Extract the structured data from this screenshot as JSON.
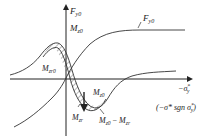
{
  "diagram": {
    "axes": {
      "y_label_main": "F",
      "y_label_main_sub": "y0",
      "y_label_second": "M",
      "y_label_second_sub": "z0",
      "x_label_prefix": "−σ",
      "x_label_sup": "*",
      "x_label_sub": "y",
      "x_label_alt": "(−σ* sgn σ",
      "x_label_alt_sup": "*",
      "x_label_alt_sub": "y",
      "x_label_alt_close": ")"
    },
    "curves": [
      {
        "name": "lateral-force-curve",
        "label": "F",
        "label_sub": "y0"
      },
      {
        "name": "aligning-moment-curve",
        "label": "M",
        "label_sub": "z0"
      },
      {
        "name": "residual-moment-curve",
        "label": "M",
        "label_sub": "zr"
      }
    ],
    "annotations": {
      "mzr0": {
        "main": "M",
        "sub": "zr0"
      },
      "mz0": {
        "main": "M",
        "sub": "z0"
      },
      "mzr": {
        "main": "M",
        "sub": "zr"
      },
      "diff": {
        "main1": "M",
        "sub1": "z0",
        "minus": " − ",
        "main2": "M",
        "sub2": "zr"
      }
    },
    "hatch_region": "area between M_z0 and M_zr curves"
  }
}
